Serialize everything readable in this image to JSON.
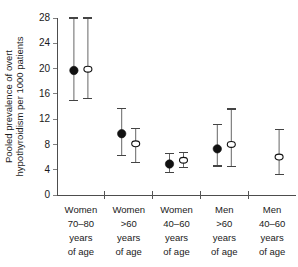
{
  "chart_data": {
    "type": "scatter",
    "title": "",
    "xlabel": "",
    "ylabel": "Pooled prevalence of overt hypothyroidism per 1000 patients",
    "ylabel_line1": "Pooled prevalence of overt",
    "ylabel_line2": "hypothyroidism per 1000 patients",
    "ylim": [
      0,
      28
    ],
    "yticks": [
      0,
      4,
      8,
      12,
      16,
      20,
      24,
      28
    ],
    "ytick_labels": [
      "0",
      "4",
      "8",
      "12",
      "16",
      "20",
      "24",
      "28"
    ],
    "grid": false,
    "legend": "none",
    "categories": [
      "Women 70–80 years of age",
      "Women >60 years of age",
      "Women 40–60 years of age",
      "Men >60 years of age",
      "Men 40–60 years of age"
    ],
    "category_lines": [
      [
        "Women",
        "70–80",
        "years",
        "of age"
      ],
      [
        "Women",
        ">60",
        "years",
        "of age"
      ],
      [
        "Women",
        "40–60",
        "years",
        "of age"
      ],
      [
        "Men",
        ">60",
        "years",
        "of age"
      ],
      [
        "Men",
        "40–60",
        "years",
        "of age"
      ]
    ],
    "series": [
      {
        "name": "filled-circle",
        "marker": "filled circle",
        "color": "#111111",
        "points": [
          {
            "category": "Women 70–80 years of age",
            "value": 19.7,
            "ci_low": 15.0,
            "ci_high": 28.0
          },
          {
            "category": "Women >60 years of age",
            "value": 9.7,
            "ci_low": 6.2,
            "ci_high": 13.7
          },
          {
            "category": "Women 40–60 years of age",
            "value": 4.9,
            "ci_low": 3.6,
            "ci_high": 6.6
          },
          {
            "category": "Men >60 years of age",
            "value": 7.3,
            "ci_low": 4.6,
            "ci_high": 11.2
          },
          {
            "category": "Men 40–60 years of age",
            "value": null,
            "ci_low": null,
            "ci_high": null
          }
        ]
      },
      {
        "name": "open-circle",
        "marker": "open circle",
        "color": "#ffffff",
        "points": [
          {
            "category": "Women 70–80 years of age",
            "value": 19.9,
            "ci_low": 15.3,
            "ci_high": 28.0
          },
          {
            "category": "Women >60 years of age",
            "value": 8.1,
            "ci_low": 5.2,
            "ci_high": 10.5
          },
          {
            "category": "Women 40–60 years of age",
            "value": 5.5,
            "ci_low": 4.4,
            "ci_high": 6.7
          },
          {
            "category": "Men >60 years of age",
            "value": 8.0,
            "ci_low": 4.5,
            "ci_high": 13.6
          },
          {
            "category": "Men 40–60 years of age",
            "value": 6.0,
            "ci_low": 3.2,
            "ci_high": 10.3
          }
        ]
      }
    ]
  }
}
